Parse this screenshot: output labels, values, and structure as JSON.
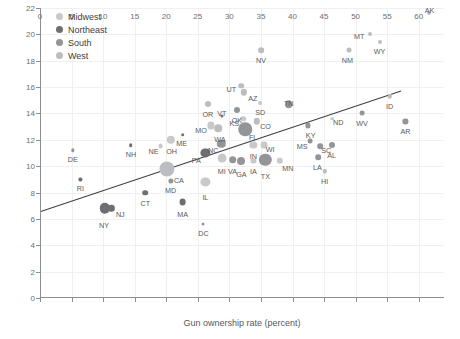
{
  "chart_data": {
    "type": "scatter",
    "title": "",
    "xlabel": "Gun ownership rate (percent)",
    "ylabel": "",
    "xlim": [
      0,
      64
    ],
    "ylim": [
      0,
      22
    ],
    "xticks": [
      0,
      5,
      10,
      15,
      20,
      25,
      30,
      35,
      40,
      45,
      50,
      55,
      60
    ],
    "yticks": [
      0,
      2,
      4,
      6,
      8,
      10,
      12,
      14,
      16,
      18,
      20,
      22
    ],
    "grid": true,
    "legend_position": "top-left",
    "trendline": {
      "x0": 0,
      "y0": 6.55,
      "x1": 57.2,
      "y1": 15.7
    },
    "region_colors": {
      "Midwest": "#c9c9c9",
      "Northeast": "#6d6e71",
      "South": "#939598",
      "West": "#bcbdc0"
    },
    "legend": [
      {
        "label": "Midwest",
        "color": "#c9c9c9"
      },
      {
        "label": "Northeast",
        "color": "#6d6e71"
      },
      {
        "label": "South",
        "color": "#939598"
      },
      {
        "label": "West",
        "color": "#bcbdc0"
      }
    ],
    "points": [
      {
        "label": "AK",
        "x": 61.7,
        "y": 21.6,
        "r": 2.0,
        "region": "West",
        "lx": 0,
        "ly": -9
      },
      {
        "label": "MT",
        "x": 52.3,
        "y": 20.0,
        "r": 2.0,
        "region": "West",
        "lx": -11,
        "ly": -4
      },
      {
        "label": "WY",
        "x": 53.8,
        "y": 19.4,
        "r": 2.0,
        "region": "West",
        "lx": 0,
        "ly": 3
      },
      {
        "label": "NM",
        "x": 49.0,
        "y": 18.8,
        "r": 2.5,
        "region": "West",
        "lx": -2,
        "ly": 3
      },
      {
        "label": "NV",
        "x": 35.0,
        "y": 18.8,
        "r": 2.8,
        "region": "West",
        "lx": 0,
        "ly": 3
      },
      {
        "label": "UT",
        "x": 31.9,
        "y": 16.1,
        "r": 2.8,
        "region": "West",
        "lx": -10,
        "ly": -4
      },
      {
        "label": "AZ",
        "x": 32.3,
        "y": 15.6,
        "r": 3.2,
        "region": "West",
        "lx": 9,
        "ly": -2
      },
      {
        "label": "ID",
        "x": 55.4,
        "y": 15.3,
        "r": 2.2,
        "region": "West",
        "lx": 0,
        "ly": 3
      },
      {
        "label": "OR",
        "x": 26.6,
        "y": 14.7,
        "r": 3.0,
        "region": "West",
        "lx": 0,
        "ly": 3
      },
      {
        "label": "SD",
        "x": 34.9,
        "y": 14.8,
        "r": 2.0,
        "region": "Midwest",
        "lx": 0,
        "ly": 3
      },
      {
        "label": "TN",
        "x": 39.4,
        "y": 14.7,
        "r": 3.8,
        "region": "South",
        "lx": 0,
        "ly": -9
      },
      {
        "label": "OK",
        "x": 31.2,
        "y": 14.3,
        "r": 3.0,
        "region": "South",
        "lx": 0,
        "ly": 3
      },
      {
        "label": "WV",
        "x": 51.0,
        "y": 14.0,
        "r": 2.4,
        "region": "South",
        "lx": 0,
        "ly": 3
      },
      {
        "label": "AR",
        "x": 57.9,
        "y": 13.4,
        "r": 2.6,
        "region": "South",
        "lx": 0,
        "ly": 3
      },
      {
        "label": "ND",
        "x": 46.3,
        "y": 13.6,
        "r": 1.8,
        "region": "Midwest",
        "lx": 6,
        "ly": -3
      },
      {
        "label": "CO",
        "x": 34.3,
        "y": 13.4,
        "r": 3.2,
        "region": "West",
        "lx": 9,
        "ly": -3
      },
      {
        "label": "KS",
        "x": 32.2,
        "y": 13.6,
        "r": 2.8,
        "region": "Midwest",
        "lx": -9,
        "ly": -3
      },
      {
        "label": "VT",
        "x": 28.8,
        "y": 13.8,
        "r": 1.6,
        "region": "Northeast",
        "lx": 0,
        "ly": -9
      },
      {
        "label": "MO",
        "x": 27.1,
        "y": 13.1,
        "r": 3.6,
        "region": "Midwest",
        "lx": -10,
        "ly": -3
      },
      {
        "label": "WA",
        "x": 28.2,
        "y": 12.9,
        "r": 3.8,
        "region": "West",
        "lx": 2,
        "ly": 3
      },
      {
        "label": "FL",
        "x": 32.5,
        "y": 12.8,
        "r": 6.8,
        "region": "South",
        "lx": 8,
        "ly": -3
      },
      {
        "label": "KY",
        "x": 42.4,
        "y": 13.1,
        "r": 2.6,
        "region": "South",
        "lx": 3,
        "ly": 3
      },
      {
        "label": "MS",
        "x": 42.8,
        "y": 11.9,
        "r": 2.4,
        "region": "South",
        "lx": -8,
        "ly": -2
      },
      {
        "label": "SC",
        "x": 44.4,
        "y": 11.5,
        "r": 2.8,
        "region": "South",
        "lx": 6,
        "ly": -3
      },
      {
        "label": "AL",
        "x": 46.2,
        "y": 11.6,
        "r": 3.0,
        "region": "South",
        "lx": 0,
        "ly": 3
      },
      {
        "label": "NH",
        "x": 14.4,
        "y": 11.6,
        "r": 1.8,
        "region": "Northeast",
        "lx": 0,
        "ly": 3
      },
      {
        "label": "ME",
        "x": 22.6,
        "y": 12.4,
        "r": 1.8,
        "region": "Northeast",
        "lx": -1,
        "ly": 3
      },
      {
        "label": "NC",
        "x": 28.7,
        "y": 11.7,
        "r": 4.2,
        "region": "South",
        "lx": -8,
        "ly": -2
      },
      {
        "label": "IN",
        "x": 33.8,
        "y": 11.6,
        "r": 3.6,
        "region": "Midwest",
        "lx": 0,
        "ly": 3
      },
      {
        "label": "WI",
        "x": 35.5,
        "y": 11.6,
        "r": 3.4,
        "region": "Midwest",
        "lx": 6,
        "ly": -3
      },
      {
        "label": "OH",
        "x": 20.7,
        "y": 12.0,
        "r": 4.2,
        "region": "Midwest",
        "lx": 1,
        "ly": 3
      },
      {
        "label": "NE",
        "x": 19.1,
        "y": 11.5,
        "r": 2.4,
        "region": "Midwest",
        "lx": -7,
        "ly": -2
      },
      {
        "label": "DE",
        "x": 5.2,
        "y": 11.2,
        "r": 1.7,
        "region": "South",
        "lx": 0,
        "ly": 3
      },
      {
        "label": "PA",
        "x": 26.2,
        "y": 11.0,
        "r": 4.6,
        "region": "Northeast",
        "lx": -9,
        "ly": -2
      },
      {
        "label": "MI",
        "x": 28.8,
        "y": 10.6,
        "r": 4.4,
        "region": "Midwest",
        "lx": 0,
        "ly": 4
      },
      {
        "label": "VA",
        "x": 30.5,
        "y": 10.5,
        "r": 3.8,
        "region": "South",
        "lx": 0,
        "ly": 4
      },
      {
        "label": "GA",
        "x": 31.9,
        "y": 10.4,
        "r": 4.0,
        "region": "South",
        "lx": 0,
        "ly": 5
      },
      {
        "label": "IA",
        "x": 33.8,
        "y": 10.4,
        "r": 2.6,
        "region": "Midwest",
        "lx": 0,
        "ly": 3
      },
      {
        "label": "TX",
        "x": 35.7,
        "y": 10.5,
        "r": 6.2,
        "region": "South",
        "lx": 0,
        "ly": 6
      },
      {
        "label": "MN",
        "x": 38.0,
        "y": 10.4,
        "r": 3.2,
        "region": "Midwest",
        "lx": 8,
        "ly": 0
      },
      {
        "label": "LA",
        "x": 44.1,
        "y": 10.7,
        "r": 2.8,
        "region": "South",
        "lx": -1,
        "ly": 3
      },
      {
        "label": "HI",
        "x": 45.1,
        "y": 9.6,
        "r": 2.2,
        "region": "West",
        "lx": 0,
        "ly": 3
      },
      {
        "label": "CA",
        "x": 20.1,
        "y": 9.8,
        "r": 7.6,
        "region": "West",
        "lx": 12,
        "ly": 0
      },
      {
        "label": "MD",
        "x": 20.7,
        "y": 8.9,
        "r": 2.6,
        "region": "South",
        "lx": 0,
        "ly": 3
      },
      {
        "label": "IL",
        "x": 26.2,
        "y": 8.8,
        "r": 4.6,
        "region": "Midwest",
        "lx": 0,
        "ly": 6
      },
      {
        "label": "RI",
        "x": 6.4,
        "y": 9.0,
        "r": 1.6,
        "region": "Northeast",
        "lx": 0,
        "ly": 3
      },
      {
        "label": "CT",
        "x": 16.7,
        "y": 8.0,
        "r": 2.8,
        "region": "Northeast",
        "lx": 0,
        "ly": 4
      },
      {
        "label": "MA",
        "x": 22.6,
        "y": 7.3,
        "r": 3.4,
        "region": "Northeast",
        "lx": 0,
        "ly": 5
      },
      {
        "label": "NY",
        "x": 10.3,
        "y": 6.8,
        "r": 5.2,
        "region": "Northeast",
        "lx": -1,
        "ly": 7
      },
      {
        "label": "NJ",
        "x": 11.3,
        "y": 6.8,
        "r": 3.2,
        "region": "Northeast",
        "lx": 9,
        "ly": -2
      },
      {
        "label": "DC",
        "x": 25.9,
        "y": 5.6,
        "r": 1.5,
        "region": "South",
        "lx": 0,
        "ly": 3
      }
    ]
  }
}
